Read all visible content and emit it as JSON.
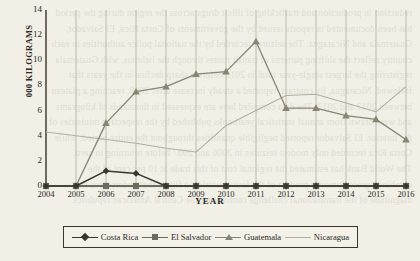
{
  "chart_data": {
    "type": "line",
    "title": "",
    "xlabel": "YEAR",
    "ylabel": "000 KILOGRAMS",
    "x": [
      2004,
      2005,
      2006,
      2007,
      2008,
      2009,
      2010,
      2011,
      2012,
      2013,
      2014,
      2015,
      2016
    ],
    "xticklabels": [
      "2004",
      "2005",
      "2006",
      "2007",
      "2008",
      "2009",
      "2010",
      "2011",
      "2012",
      "2013",
      "2014",
      "2015",
      "2016"
    ],
    "yticks": [
      0,
      2,
      4,
      6,
      8,
      10,
      12,
      14
    ],
    "yticklabels": [
      "0",
      "2",
      "4",
      "6",
      "8",
      "10",
      "12",
      "14"
    ],
    "ylim": [
      0,
      14
    ],
    "xlim": [
      2004,
      2016
    ],
    "grid": "vertical",
    "legend_position": "bottom",
    "series": [
      {
        "name": "Costa Rica",
        "marker": "diamond",
        "color": "#3b372f",
        "values": [
          0,
          0,
          1.2,
          1.0,
          0,
          0,
          0,
          0,
          0,
          0,
          0,
          0,
          0
        ]
      },
      {
        "name": "El Salvador",
        "marker": "square",
        "color": "#6f6a5c",
        "values": [
          0,
          0,
          0,
          0,
          0,
          0,
          0,
          0,
          0,
          0,
          0,
          0,
          0
        ]
      },
      {
        "name": "Guatemala",
        "marker": "triangle",
        "color": "#8a8475",
        "values": [
          0,
          0,
          5.0,
          7.5,
          7.9,
          8.9,
          9.1,
          11.5,
          6.2,
          6.2,
          5.6,
          5.3,
          3.7
        ]
      },
      {
        "name": "Nicaragua",
        "marker": "none",
        "color": "#b3ae9f",
        "values": [
          4.3,
          4.0,
          3.7,
          3.4,
          3.0,
          2.7,
          4.8,
          6.0,
          7.2,
          7.3,
          6.6,
          5.9,
          7.9
        ]
      }
    ]
  },
  "bleed_text": "reduction in production and trafficking of illicit drugs across the region during the period\nhas been documented in reports issued by the governments of Costa Rica, El Salvador,\nGuatemala and Nicaragua. The seizures recorded by the national police authorities in each\ncountry reflect the shifting patterns of transit routes through the isthmus, with Guatemala\nregistering the largest single-year total in 2011 before a sharp decline in the years that\nfollowed. Nicaragua, by contrast, reported a steady increase after 2009, reaching a plateau\nbetween 2012 and 2013. The data compiled here are expressed in thousands of kilograms\nand were drawn from annual statistical yearbooks published by the respective ministries of\nthe interior. El Salvador reported negligible quantities throughout the entire period, while\nCosta Rica recorded only modest seizures in 2006 and 2007 before returning to zero.\nThe World Bank has estimated the regional cost of this trade at 10 per cent of the\ncombined gross domestic product of the four countries, a figure that underscores the\nmagnitude of the transnational challenge confronting the Central American republics."
}
